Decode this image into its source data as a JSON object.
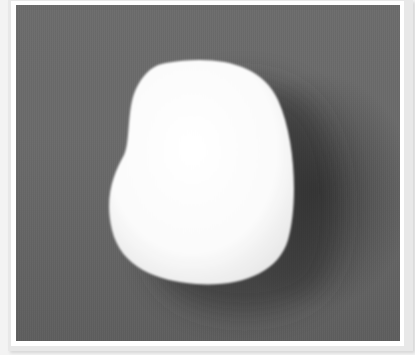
{
  "image": {
    "subject": "white smooth egg-shaped stone",
    "background_color": "#666666",
    "stone_color": "#fafafa",
    "shadow_color": "#3a3a3a",
    "frame_color": "#ffffff"
  }
}
